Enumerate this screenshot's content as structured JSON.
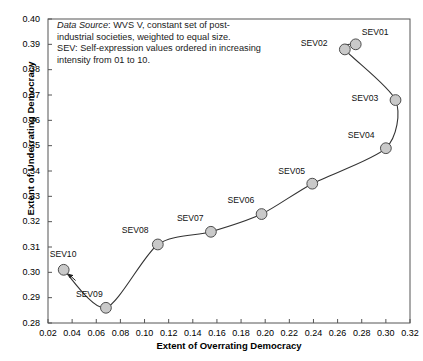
{
  "chart_data": {
    "type": "scatter",
    "title": "",
    "xlabel": "Extent of Overrating Democracy",
    "ylabel": "Extent of Underrating Democracy",
    "xlim": [
      0.02,
      0.32
    ],
    "ylim": [
      0.28,
      0.4
    ],
    "xticks": [
      "0.02",
      "0.04",
      "0.06",
      "0.08",
      "0.10",
      "0.12",
      "0.14",
      "0.16",
      "0.18",
      "0.20",
      "0.22",
      "0.24",
      "0.26",
      "0.28",
      "0.30",
      "0.32"
    ],
    "yticks": [
      "0.28",
      "0.29",
      "0.30",
      "0.31",
      "0.32",
      "0.33",
      "0.34",
      "0.35",
      "0.36",
      "0.37",
      "0.38",
      "0.39",
      "0.40"
    ],
    "grid": false,
    "legend": "none",
    "connected": true,
    "marker_fill": "#c9c9c9",
    "marker_stroke": "#4d4d4d",
    "line_color": "#333333",
    "points": [
      {
        "label": "SEV01",
        "x": 0.275,
        "y": 0.39,
        "label_pos": "above-right"
      },
      {
        "label": "SEV02",
        "x": 0.266,
        "y": 0.388,
        "label_pos": "left"
      },
      {
        "label": "SEV03",
        "x": 0.308,
        "y": 0.368,
        "label_pos": "left"
      },
      {
        "label": "SEV04",
        "x": 0.3,
        "y": 0.349,
        "label_pos": "above-left"
      },
      {
        "label": "SEV05",
        "x": 0.239,
        "y": 0.335,
        "label_pos": "above-left"
      },
      {
        "label": "SEV06",
        "x": 0.197,
        "y": 0.323,
        "label_pos": "above-left"
      },
      {
        "label": "SEV07",
        "x": 0.155,
        "y": 0.316,
        "label_pos": "above-left"
      },
      {
        "label": "SEV08",
        "x": 0.111,
        "y": 0.311,
        "label_pos": "above-left"
      },
      {
        "label": "SEV09",
        "x": 0.068,
        "y": 0.286,
        "label_pos": "above-left"
      },
      {
        "label": "SEV10",
        "x": 0.033,
        "y": 0.301,
        "label_pos": "above-left"
      }
    ],
    "annotation": {
      "line1_emph": "Data Source",
      "line1_rest": ": WVS V, constant set of post-",
      "line2": "industrial societies, weighted to equal size.",
      "line3": "SEV: Self-expression values ordered in increasing",
      "line4": "intensity from 01 to 10."
    }
  }
}
